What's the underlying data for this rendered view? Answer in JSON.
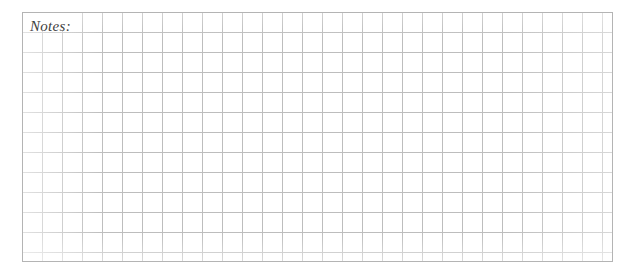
{
  "page": {
    "width": 635,
    "height": 276,
    "background_color": "#ffffff",
    "kind": "blank-squared-notes-sheet"
  },
  "notes_section": {
    "label": "Notes:",
    "label_text_color": "#404040",
    "label_font_style": "italic-serif",
    "label_font_size_px": 15,
    "label_left_px": 30,
    "label_top_px": 17,
    "writing_area_is_blank": true
  },
  "grid": {
    "left_px": 22,
    "top_px": 12,
    "right_px": 613,
    "bottom_px": 262,
    "width_px": 591,
    "height_px": 250,
    "cell_size_px": 20,
    "columns": 29.5,
    "rows": 12.5,
    "line_color": "#bdbdbd",
    "line_width_px": 1,
    "frame_color": "#b4b4b4",
    "frame_width_px": 1
  }
}
